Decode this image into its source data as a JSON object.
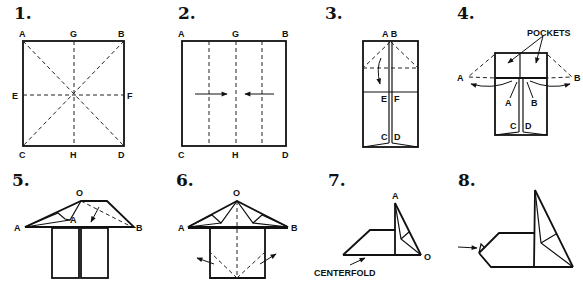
{
  "diagram": {
    "type": "origami-instructions",
    "steps": [
      {
        "number": "1.",
        "labels": {
          "A": "A",
          "G": "G",
          "B": "B",
          "E": "E",
          "F": "F",
          "C": "C",
          "H": "H",
          "D": "D"
        }
      },
      {
        "number": "2.",
        "labels": {
          "A": "A",
          "G": "G",
          "B": "B",
          "C": "C",
          "H": "H",
          "D": "D"
        }
      },
      {
        "number": "3.",
        "labels": {
          "AB": "A B",
          "E": "E",
          "F": "F",
          "C": "C",
          "D": "D"
        }
      },
      {
        "number": "4.",
        "labels": {
          "pockets": "POCKETS",
          "A_left": "A",
          "B_right": "B",
          "A_inner": "A",
          "B_inner": "B",
          "C": "C",
          "D": "D"
        }
      },
      {
        "number": "5.",
        "labels": {
          "O": "O",
          "A_left": "A",
          "A_inner": "A",
          "B": "B"
        }
      },
      {
        "number": "6.",
        "labels": {
          "O": "O",
          "A": "A",
          "B": "B"
        }
      },
      {
        "number": "7.",
        "labels": {
          "A": "A",
          "O": "O",
          "centerfold": "CENTERFOLD"
        }
      },
      {
        "number": "8.",
        "labels": {}
      }
    ],
    "colors": {
      "ink": "#111111",
      "background": "#ffffff"
    }
  }
}
